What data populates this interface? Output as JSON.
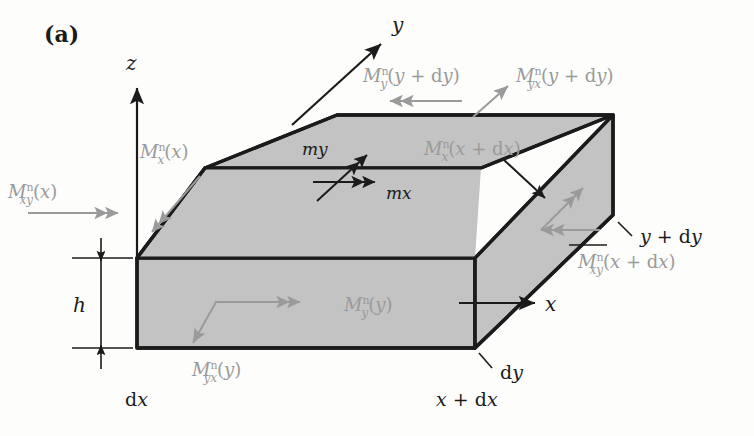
{
  "figure": {
    "panel_label": "(a)",
    "type": "3d-plate-element-moment-diagram",
    "colors": {
      "face_shading": "#c3c3c3",
      "outline": "#1b1b1b",
      "moment_arrow": "#9a9a9a",
      "axis": "#1b1b1b",
      "background": "#fdfdfc"
    }
  },
  "axes": [
    {
      "name": "z-axis",
      "label": "z"
    },
    {
      "name": "y-axis",
      "label": "y"
    },
    {
      "name": "x-axis",
      "label": "x"
    }
  ],
  "dimensions": [
    {
      "name": "thickness",
      "label": "h"
    },
    {
      "name": "element-width-x",
      "label": "dx"
    },
    {
      "name": "element-width-y",
      "label": "dy"
    },
    {
      "name": "corner-x-plus-dx",
      "label": "x + dx"
    },
    {
      "name": "corner-y-plus-dy",
      "label": "y + dy"
    }
  ],
  "distributed_moments": [
    {
      "name": "m-y",
      "label": "my"
    },
    {
      "name": "m-x",
      "label": "mx"
    }
  ],
  "moment_labels": [
    {
      "name": "M-x-n-of-x",
      "label": "Mxⁿ(x)",
      "face": "left-back",
      "arrow": "double-head-down-left"
    },
    {
      "name": "M-xy-n-of-x",
      "label": "Mxyⁿ(x)",
      "face": "left-back",
      "arrow": "double-head-right"
    },
    {
      "name": "M-y-n-of-y-plus-dy",
      "label": "Myⁿ(y + dy)",
      "face": "top-back",
      "arrow": "double-head-left"
    },
    {
      "name": "M-yx-n-of-y-plus-dy",
      "label": "Myxⁿ(y + dy)",
      "face": "top-back",
      "arrow": "single-head-up-right"
    },
    {
      "name": "M-x-n-of-x-plus-dx",
      "label": "Mxⁿ(x + dx)",
      "face": "top",
      "arrow": "none"
    },
    {
      "name": "M-xy-n-of-x-plus-dx",
      "label": "Mxyⁿ(x + dx)",
      "face": "right",
      "arrow": "double-head-left"
    },
    {
      "name": "M-y-n-of-y",
      "label": "Myⁿ(y)",
      "face": "front",
      "arrow": "double-head-right"
    },
    {
      "name": "M-yx-n-of-y",
      "label": "Myxⁿ(y)",
      "face": "front",
      "arrow": "single-head-down-left"
    }
  ]
}
